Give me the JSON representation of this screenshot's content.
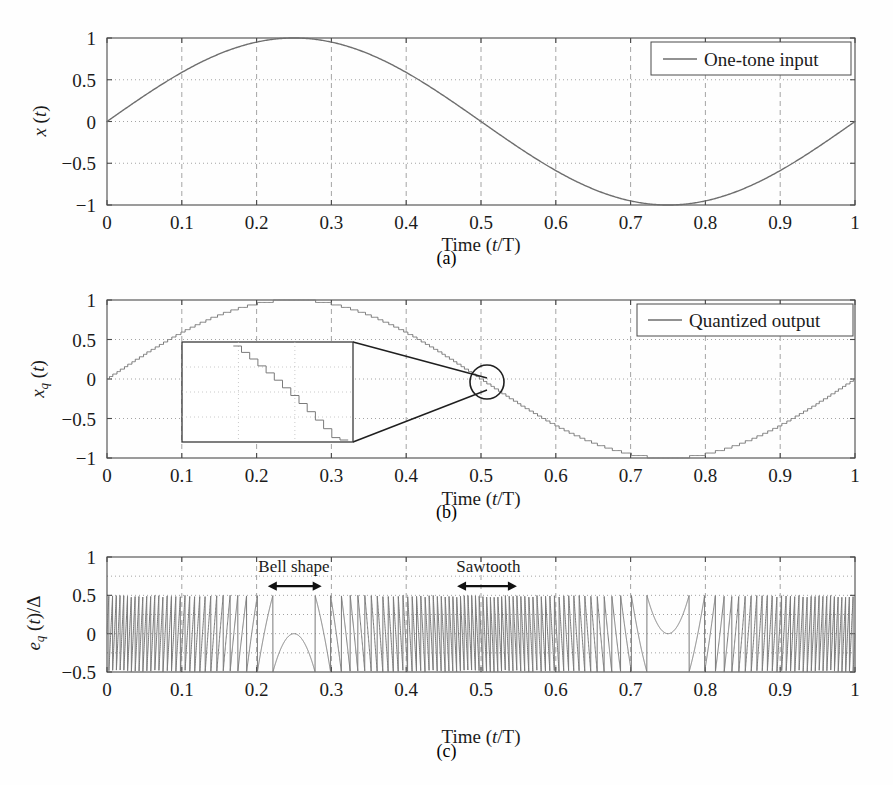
{
  "figure": {
    "background": "#fefefe",
    "line_color": "#6e6e6e",
    "axis_color": "#4a4a4a",
    "text_color": "#1b1b1b"
  },
  "panels": [
    {
      "id": "a",
      "caption": "(a)",
      "legend_label": "One-tone input",
      "ylabel_main": "x",
      "ylabel_sub": "",
      "ylabel_tail": " (t)",
      "xlabel_prefix": "Time (",
      "xlabel_var": "t",
      "xlabel_suffix": "/T)",
      "ytick_labels": [
        "1",
        "0.5",
        "0",
        "-0.5",
        "-1"
      ],
      "ytick_values": [
        1,
        0.5,
        0,
        -0.5,
        -1
      ],
      "xtick_labels": [
        "0",
        "0.1",
        "0.2",
        "0.3",
        "0.4",
        "0.5",
        "0.6",
        "0.7",
        "0.8",
        "0.9",
        "1"
      ],
      "xtick_values": [
        0,
        0.1,
        0.2,
        0.3,
        0.4,
        0.5,
        0.6,
        0.7,
        0.8,
        0.9,
        1
      ]
    },
    {
      "id": "b",
      "caption": "(b)",
      "legend_label": "Quantized output",
      "ylabel_main": "x",
      "ylabel_sub": "q",
      "ylabel_tail": " (t)",
      "xlabel_prefix": "Time (",
      "xlabel_var": "t",
      "xlabel_suffix": "/T)",
      "ytick_labels": [
        "1",
        "0.5",
        "0",
        "-0.5",
        "-1"
      ],
      "ytick_values": [
        1,
        0.5,
        0,
        -0.5,
        -1
      ],
      "xtick_labels": [
        "0",
        "0.1",
        "0.2",
        "0.3",
        "0.4",
        "0.5",
        "0.6",
        "0.7",
        "0.8",
        "0.9",
        "1"
      ],
      "xtick_values": [
        0,
        0.1,
        0.2,
        0.3,
        0.4,
        0.5,
        0.6,
        0.7,
        0.8,
        0.9,
        1
      ],
      "inset": {
        "x_range": [
          0.2,
          0.4
        ],
        "y_range": [
          -0.9,
          0.45
        ],
        "source_center": [
          0.505,
          0.02
        ]
      }
    },
    {
      "id": "c",
      "caption": "(c)",
      "legend_label": "",
      "ylabel_main": "e",
      "ylabel_sub": "q",
      "ylabel_tail": " (t)/Δ",
      "xlabel_prefix": "Time (",
      "xlabel_var": "t",
      "xlabel_suffix": "/T)",
      "ytick_labels": [
        "1",
        "0.5",
        "0",
        "-0.5"
      ],
      "ytick_values": [
        1,
        0.5,
        0,
        -0.5
      ],
      "xtick_labels": [
        "0",
        "0.1",
        "0.2",
        "0.3",
        "0.4",
        "0.5",
        "0.6",
        "0.7",
        "0.8",
        "0.9",
        "1"
      ],
      "xtick_values": [
        0,
        0.1,
        0.2,
        0.3,
        0.4,
        0.5,
        0.6,
        0.7,
        0.8,
        0.9,
        1
      ],
      "annotations": [
        {
          "label": "Bell shape",
          "x_center": 0.25,
          "x_span": [
            0.215,
            0.287
          ]
        },
        {
          "label": "Sawtooth",
          "x_center": 0.51,
          "x_span": [
            0.468,
            0.548
          ]
        }
      ]
    }
  ],
  "chart_data": [
    {
      "type": "line",
      "panel": "a",
      "title": "",
      "xlabel": "Time (t/T)",
      "ylabel": "x (t)",
      "xlim": [
        0,
        1
      ],
      "ylim": [
        -1,
        1
      ],
      "grid": true,
      "legend": [
        "One-tone input"
      ],
      "legend_position": "top-right",
      "series": [
        {
          "name": "One-tone input",
          "formula": "sin(2*pi*t)",
          "x": [
            0,
            0.05,
            0.1,
            0.15,
            0.2,
            0.25,
            0.3,
            0.35,
            0.4,
            0.45,
            0.5,
            0.55,
            0.6,
            0.65,
            0.7,
            0.75,
            0.8,
            0.85,
            0.9,
            0.95,
            1
          ],
          "values": [
            0,
            0.309,
            0.588,
            0.809,
            0.951,
            1.0,
            0.951,
            0.809,
            0.588,
            0.309,
            0,
            -0.309,
            -0.588,
            -0.809,
            -0.951,
            -1.0,
            -0.951,
            -0.809,
            -0.588,
            -0.309,
            0
          ]
        }
      ]
    },
    {
      "type": "line",
      "panel": "b",
      "title": "",
      "xlabel": "Time (t/T)",
      "ylabel": "x_q (t)",
      "xlim": [
        0,
        1
      ],
      "ylim": [
        -1,
        1
      ],
      "grid": true,
      "legend": [
        "Quantized output"
      ],
      "legend_position": "top-right",
      "series": [
        {
          "name": "Quantized output",
          "formula": "round(sin(2*pi*t)/delta)*delta, staircase",
          "quantization_levels": 64,
          "x": [
            0,
            0.05,
            0.1,
            0.15,
            0.2,
            0.25,
            0.3,
            0.35,
            0.4,
            0.45,
            0.5,
            0.55,
            0.6,
            0.65,
            0.7,
            0.75,
            0.8,
            0.85,
            0.9,
            0.95,
            1
          ],
          "values": [
            0,
            0.313,
            0.594,
            0.813,
            0.953,
            1.0,
            0.953,
            0.813,
            0.594,
            0.313,
            0,
            -0.313,
            -0.594,
            -0.813,
            -0.953,
            -1.0,
            -0.953,
            -0.813,
            -0.594,
            -0.313,
            0
          ]
        }
      ]
    },
    {
      "type": "line",
      "panel": "c",
      "title": "",
      "xlabel": "Time (t/T)",
      "ylabel": "e_q (t)/Δ",
      "xlim": [
        0,
        1
      ],
      "ylim": [
        -0.5,
        1
      ],
      "grid": true,
      "legend": [],
      "annotations": [
        "Bell shape",
        "Sawtooth"
      ],
      "series": [
        {
          "name": "Quantization error",
          "formula": "(x(t) - x_q(t))/delta",
          "amplitude_range": [
            -0.5,
            0.5
          ],
          "description": "sawtooth error bounded by +/-0.5 with bell-shaped excursions near signal peaks at t=0.25 and t=0.75"
        }
      ]
    }
  ]
}
